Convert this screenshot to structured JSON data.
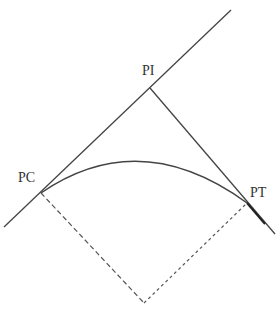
{
  "diagram": {
    "title": "",
    "type": "horizontal-curve",
    "colors": {
      "line": "#444444",
      "dashed": "#555555",
      "text": "#333333",
      "background": "#ffffff"
    },
    "labels": {
      "pi": "PI",
      "pc": "PC",
      "pt": "PT"
    },
    "points": {
      "PI": [
        150,
        88
      ],
      "PC": [
        41,
        193
      ],
      "PT": [
        247,
        203
      ],
      "center": [
        144,
        303
      ]
    },
    "elements": [
      {
        "kind": "line",
        "name": "back-tangent",
        "from": [
          4,
          227
        ],
        "to": [
          231,
          10
        ],
        "style": "solid"
      },
      {
        "kind": "line",
        "name": "forward-tangent",
        "from": [
          150,
          88
        ],
        "to": [
          275,
          234
        ],
        "style": "solid"
      },
      {
        "kind": "arc",
        "name": "circular-curve",
        "from": "PC",
        "to": "PT",
        "style": "solid"
      },
      {
        "kind": "line",
        "name": "radius-pc",
        "from": "PC",
        "to": "center",
        "style": "dashed"
      },
      {
        "kind": "line",
        "name": "radius-pt",
        "from": "center",
        "to": "PT",
        "style": "dashed"
      }
    ]
  }
}
